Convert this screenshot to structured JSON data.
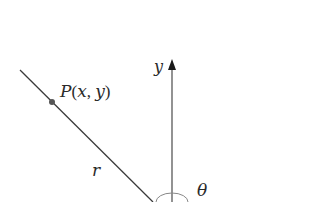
{
  "diagram": {
    "type": "polar-coordinate-angle",
    "labels": {
      "y_axis": "y",
      "point_name": "P",
      "point_open": "(",
      "point_x": "x",
      "point_comma": ", ",
      "point_y": "y",
      "point_close": ")",
      "radius": "r",
      "angle": "θ"
    },
    "colors": {
      "line": "#3a3a3a",
      "point": "#555555",
      "background": "#ffffff"
    }
  }
}
